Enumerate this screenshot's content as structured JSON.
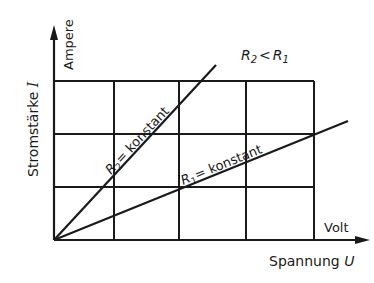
{
  "diagram": {
    "type": "ohm-law-graph",
    "y_axis": {
      "label": "Stromstärke",
      "symbol": "I",
      "unit": "Ampere"
    },
    "x_axis": {
      "label": "Spannung",
      "symbol": "U",
      "unit": "Volt"
    },
    "relation": {
      "left": "R",
      "left_sub": "2",
      "op": "<",
      "right": "R",
      "right_sub": "1"
    },
    "lines": [
      {
        "name": "R2",
        "letter": "R",
        "sub": "2",
        "text": "= konstant"
      },
      {
        "name": "R1",
        "letter": "R",
        "sub": "1",
        "text": "= konstant"
      }
    ],
    "grid": {
      "columns": 5,
      "rows": 3
    },
    "colors": {
      "ink": "#1a1a1a",
      "background": "#ffffff"
    }
  }
}
